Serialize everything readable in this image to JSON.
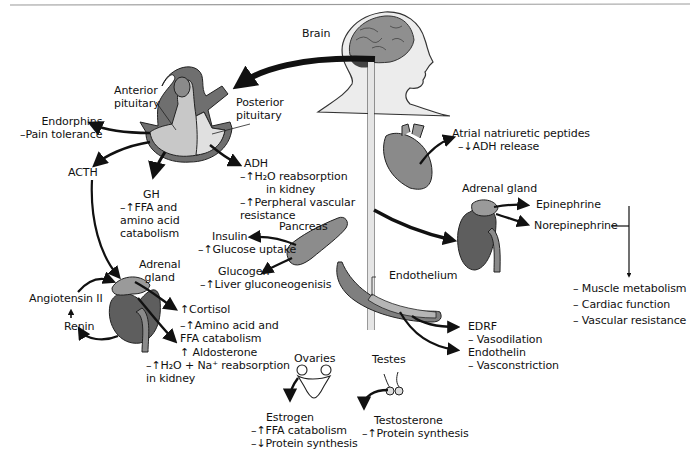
{
  "diagram": {
    "colors": {
      "organ_fill": "#7a7a7a",
      "organ_light": "#bdbdbd",
      "organ_lighter": "#d9d9d9",
      "arrow": "#111111",
      "rule": "#9a9a9a"
    },
    "nodes": {
      "brain": {
        "label": "Brain"
      },
      "anterior_pituitary": {
        "lines": [
          "Anterior",
          "pituitary"
        ]
      },
      "posterior_pituitary": {
        "lines": [
          "Posterior",
          "pituitary"
        ]
      },
      "endorphins": {
        "lines": [
          "Endorphins",
          "–Pain tolerance"
        ]
      },
      "acth": {
        "label": "ACTH"
      },
      "gh": {
        "lines": [
          "GH",
          "–↑FFA and",
          "amino acid",
          "catabolism"
        ]
      },
      "adh": {
        "lines": [
          "ADH",
          "–↑H₂O reabsorption",
          "in kidney",
          "–↑Perpheral vascular",
          "resistance"
        ]
      },
      "pancreas": {
        "label": "Pancreas"
      },
      "insulin": {
        "lines": [
          "Insulin",
          "–↑Glucose uptake"
        ]
      },
      "glucogen": {
        "lines": [
          "Glucogen",
          "–↑Liver gluconeogenisis"
        ]
      },
      "adrenal_left": {
        "lines": [
          "Adrenal",
          "gland"
        ]
      },
      "angiotensin": {
        "label": "Angiotensin II"
      },
      "renin": {
        "label": "Renin"
      },
      "cortisol": {
        "lines": [
          "↑Cortisol",
          "–↑Amino acid and",
          "FFA catabolism"
        ]
      },
      "aldosterone": {
        "lines": [
          "↑ Aldosterone",
          "–↑H₂O + Na⁺ reabsorption",
          "in kidney"
        ]
      },
      "ovaries": {
        "label": "Ovaries"
      },
      "estrogen": {
        "lines": [
          "Estrogen",
          "–↑FFA catabolism",
          "–↓Protein synthesis"
        ]
      },
      "testes": {
        "label": "Testes"
      },
      "testosterone": {
        "lines": [
          "Testosterone",
          "–↑Protein synthesis"
        ]
      },
      "atrial": {
        "lines": [
          "Atrial natriuretic peptides",
          "–↓ADH release"
        ]
      },
      "adrenal_right": {
        "label": "Adrenal gland"
      },
      "epinephrine": {
        "label": "Epinephrine"
      },
      "norepinephrine": {
        "label": "Norepinephrine"
      },
      "catecholamine_effects": {
        "lines": [
          "– Muscle metabolism",
          "– Cardiac function",
          "– Vascular resistance"
        ]
      },
      "endothelium": {
        "label": "Endothelium"
      },
      "edrf": {
        "lines": [
          "EDRF",
          "– Vasodilation"
        ]
      },
      "endothelin": {
        "lines": [
          "Endothelin",
          "– Vasconstriction"
        ]
      }
    }
  }
}
